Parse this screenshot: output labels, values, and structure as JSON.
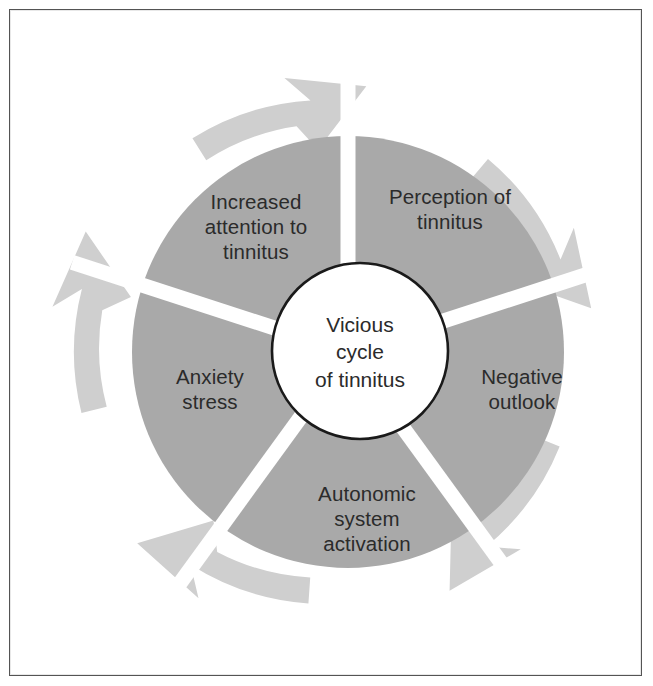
{
  "figure": {
    "name": "vicious-cycle-of-tinnitus-diagram",
    "center": {
      "label": "Vicious\ncycle\nof tinnitus"
    },
    "segments": [
      {
        "id": "perception-of-tinnitus",
        "label": "Perception of\ntinnitus"
      },
      {
        "id": "negative-outlook",
        "label": "Negative\noutlook"
      },
      {
        "id": "autonomic-system-activation",
        "label": "Autonomic\nsystem\nactivation"
      },
      {
        "id": "anxiety-stress",
        "label": "Anxiety\nstress"
      },
      {
        "id": "increased-attention-to-tinnitus",
        "label": "Increased\nattention to\ntinnitus"
      }
    ],
    "arrows": {
      "count": 5,
      "direction": "clockwise",
      "icon": "curved-arrow-icon"
    },
    "colors": {
      "pie_fill": "#a9a9a9",
      "arrow_fill": "#cfcfcf",
      "center_fill": "#ffffff",
      "center_stroke": "#1a1a1a",
      "divider": "#ffffff",
      "text": "#2b2b2b",
      "frame": "#545454",
      "background": "#ffffff"
    }
  }
}
